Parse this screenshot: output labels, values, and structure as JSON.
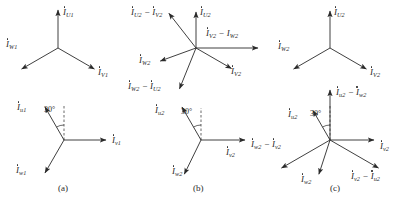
{
  "figure": {
    "width": 407,
    "height": 200,
    "background": "#ffffff",
    "stroke_color": "#2a2a2a",
    "text_color": "#2a2a2a",
    "angle_text": "30°"
  },
  "captions": [
    {
      "text": "(a)",
      "x": 58,
      "y": 184
    },
    {
      "text": "(b)",
      "x": 193,
      "y": 184
    },
    {
      "text": "(c)",
      "x": 330,
      "y": 184
    }
  ],
  "panels": [
    {
      "id": "panel-a-top",
      "origin": {
        "x": 58,
        "y": 48
      },
      "phasors": [
        {
          "name": "I_U1",
          "symbol": "I",
          "sub": "U1",
          "dot": true,
          "angle_deg": 90,
          "length": 38,
          "label": {
            "x": 63,
            "y": 8
          }
        },
        {
          "name": "I_V1",
          "symbol": "I",
          "sub": "V1",
          "dot": true,
          "angle_deg": -30,
          "length": 42,
          "label": {
            "x": 98,
            "y": 68
          }
        },
        {
          "name": "I_W1",
          "symbol": "I",
          "sub": "W1",
          "dot": true,
          "angle_deg": 210,
          "length": 42,
          "label": {
            "x": 6,
            "y": 40
          }
        }
      ],
      "angle_arc": null
    },
    {
      "id": "panel-a-bottom",
      "origin": {
        "x": 64,
        "y": 140
      },
      "phasors": [
        {
          "name": "I_u1",
          "symbol": "I",
          "sub": "u1",
          "dot": true,
          "angle_deg": 120,
          "length": 38,
          "label": {
            "x": 17,
            "y": 103
          }
        },
        {
          "name": "I_v1",
          "symbol": "I",
          "sub": "v1",
          "dot": true,
          "angle_deg": 0,
          "length": 42,
          "label": {
            "x": 112,
            "y": 136
          }
        },
        {
          "name": "I_w1",
          "symbol": "I",
          "sub": "w1",
          "dot": true,
          "angle_deg": 240,
          "length": 38,
          "label": {
            "x": 16,
            "y": 166
          }
        }
      ],
      "angle_arc": {
        "text": "30°",
        "ref_angle_deg": 90,
        "ref_length": 34,
        "label": {
          "x": 44,
          "y": 106
        }
      }
    },
    {
      "id": "panel-b-top",
      "origin": {
        "x": 196,
        "y": 48
      },
      "phasors": [
        {
          "name": "I_U2",
          "symbol": "I",
          "sub": "U2",
          "dot": true,
          "angle_deg": 90,
          "length": 36,
          "label": {
            "x": 200,
            "y": 8
          }
        },
        {
          "name": "I_V2",
          "symbol": "I",
          "sub": "V2",
          "dot": true,
          "angle_deg": -30,
          "length": 41,
          "label": {
            "x": 231,
            "y": 67
          }
        },
        {
          "name": "I_W2",
          "symbol": "I",
          "sub": "W2",
          "dot": true,
          "angle_deg": 200,
          "length": 38,
          "label": {
            "x": 139,
            "y": 56
          }
        },
        {
          "name": "I_U2_minus_I_V2",
          "symbol": "I",
          "sub": "U2",
          "dot": true,
          "op": "−",
          "symbol2": "I",
          "sub2": "V2",
          "dot2": true,
          "angle_deg": 128,
          "length": 44,
          "label": {
            "x": 131,
            "y": 8
          }
        },
        {
          "name": "I_V2_minus_I_W2",
          "symbol": "I",
          "sub": "V2",
          "dot": false,
          "op": "−",
          "symbol2": "I",
          "sub2": "W2",
          "dot2": false,
          "angle_deg": 0,
          "length": 62,
          "label": {
            "x": 206,
            "y": 29
          }
        },
        {
          "name": "I_W2_minus_I_U2",
          "symbol": "I",
          "sub": "W2",
          "dot": true,
          "op": "−",
          "symbol2": "I",
          "sub2": "U2",
          "dot2": true,
          "angle_deg": 248,
          "length": 44,
          "label": {
            "x": 128,
            "y": 82
          }
        }
      ],
      "angle_arc": null
    },
    {
      "id": "panel-b-bottom",
      "origin": {
        "x": 201,
        "y": 140
      },
      "phasors": [
        {
          "name": "I_u2",
          "symbol": "I",
          "sub": "u2",
          "dot": true,
          "angle_deg": 120,
          "length": 38,
          "label": {
            "x": 155,
            "y": 106
          }
        },
        {
          "name": "I_v2",
          "symbol": "I",
          "sub": "v2",
          "dot": true,
          "angle_deg": 0,
          "length": 44,
          "label": {
            "x": 226,
            "y": 148
          }
        },
        {
          "name": "I_w2",
          "symbol": "I",
          "sub": "w2",
          "dot": true,
          "angle_deg": 244,
          "length": 38,
          "label": {
            "x": 172,
            "y": 167
          }
        }
      ],
      "angle_arc": {
        "text": "30°",
        "ref_angle_deg": 90,
        "ref_length": 32,
        "label": {
          "x": 181,
          "y": 108
        }
      }
    },
    {
      "id": "panel-c-top",
      "origin": {
        "x": 330,
        "y": 48
      },
      "phasors": [
        {
          "name": "I_U2",
          "symbol": "I",
          "sub": "U2",
          "dot": true,
          "angle_deg": 90,
          "length": 37,
          "label": {
            "x": 334,
            "y": 8
          }
        },
        {
          "name": "I_V2",
          "symbol": "I",
          "sub": "V2",
          "dot": true,
          "angle_deg": -30,
          "length": 42,
          "label": {
            "x": 370,
            "y": 68
          }
        },
        {
          "name": "I_W2",
          "symbol": "I",
          "sub": "W2",
          "dot": true,
          "angle_deg": 210,
          "length": 42,
          "label": {
            "x": 278,
            "y": 42
          }
        }
      ],
      "angle_arc": null
    },
    {
      "id": "panel-c-bottom",
      "origin": {
        "x": 330,
        "y": 140
      },
      "phasors": [
        {
          "name": "I_u2",
          "symbol": "I",
          "sub": "u2",
          "dot": true,
          "angle_deg": 120,
          "length": 34,
          "label": {
            "x": 288,
            "y": 110
          }
        },
        {
          "name": "I_v2",
          "symbol": "I",
          "sub": "v2",
          "dot": true,
          "angle_deg": 0,
          "length": 44,
          "label": {
            "x": 380,
            "y": 142
          }
        },
        {
          "name": "I_w2",
          "symbol": "I",
          "sub": "w2",
          "dot": true,
          "angle_deg": 252,
          "length": 36,
          "label": {
            "x": 301,
            "y": 175
          }
        },
        {
          "name": "I_u2_minus_I_w2",
          "symbol": "I",
          "sub": "u2",
          "dot": true,
          "op": "−",
          "symbol2": "I",
          "sub2": "w2",
          "dot2": true,
          "angle_deg": 90,
          "length": 50,
          "label": {
            "x": 336,
            "y": 88
          }
        },
        {
          "name": "I_w2_minus_I_v2",
          "symbol": "I",
          "sub": "w2",
          "dot": true,
          "op": "−",
          "symbol2": "I",
          "sub2": "v2",
          "dot2": true,
          "angle_deg": 210,
          "length": 56,
          "label": {
            "x": 251,
            "y": 140
          }
        },
        {
          "name": "I_v2_minus_I_u2",
          "symbol": "I",
          "sub": "v2",
          "dot": true,
          "op": "−",
          "symbol2": "I",
          "sub2": "u2",
          "dot2": true,
          "angle_deg": -30,
          "length": 56,
          "label": {
            "x": 351,
            "y": 172
          }
        }
      ],
      "angle_arc": {
        "text": "30°",
        "ref_angle_deg": 90,
        "ref_length": 34,
        "label": {
          "x": 310,
          "y": 110
        }
      }
    }
  ]
}
